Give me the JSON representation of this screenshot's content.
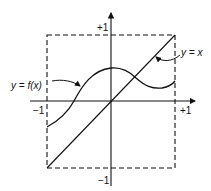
{
  "diagram": {
    "title": "",
    "labels": {
      "curve": "y = f(x)",
      "diagonal": "y = x",
      "x_neg": "−1",
      "x_pos": "+1",
      "y_pos": "+1",
      "y_neg": "−1"
    },
    "box": {
      "x_range": [
        -1,
        1
      ],
      "y_range": [
        -1,
        1
      ],
      "style": "dashed"
    },
    "colors": {
      "stroke": "#111111",
      "background": "#ffffff"
    },
    "elements": [
      "x-axis with arrow",
      "y-axis with arrow",
      "dashed square [-1,1]x[-1,1]",
      "diagonal line y = x",
      "curve y = f(x) starting at (-1, -0.35), rising to peak near (0, 0.5), crossing y=x, dipping near (0.8, 0.2), ending at (1, 0.3)",
      "leader arrows to curve and diagonal labels"
    ]
  }
}
